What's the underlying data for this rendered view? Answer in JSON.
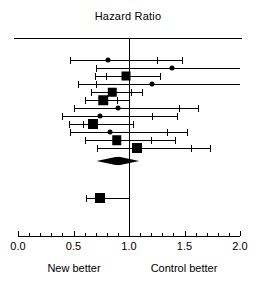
{
  "chart_data": {
    "type": "forest",
    "title": "Hazard Ratio",
    "xlabel": "",
    "ylabel": "",
    "xlim": [
      0.0,
      2.0
    ],
    "grid": false,
    "null_value": 1.0,
    "xticks": [
      0.0,
      0.5,
      1.0,
      1.5,
      2.0
    ],
    "xticklabels": [
      "0.0",
      "0.5",
      "1.0",
      "1.5",
      "2.0"
    ],
    "minor_tick_step": 0.1,
    "left_footer": "New better",
    "right_footer": "Control better",
    "marker_color": "#000000",
    "line_color": "#000000",
    "studies": [
      {
        "id": "study-1",
        "marker": "circle",
        "estimate": 0.81,
        "ci_low": 0.47,
        "ci_high": 1.48,
        "extra_cap": 1.25,
        "clipped_right": false,
        "size": 5.0
      },
      {
        "id": "study-2",
        "marker": "circle",
        "estimate": 1.39,
        "ci_low": 0.7,
        "ci_high": 2.0,
        "extra_cap": null,
        "clipped_right": true,
        "size": 5.0
      },
      {
        "id": "study-3",
        "marker": "square",
        "estimate": 0.97,
        "ci_low": 0.69,
        "ci_high": 1.28,
        "extra_cap": 0.79,
        "clipped_right": false,
        "size": 9.0
      },
      {
        "id": "study-4",
        "marker": "circle",
        "estimate": 1.21,
        "ci_low": 0.54,
        "ci_high": 2.0,
        "extra_cap": 0.7,
        "clipped_right": true,
        "size": 5.0
      },
      {
        "id": "study-5",
        "marker": "square",
        "estimate": 0.85,
        "ci_low": 0.66,
        "ci_high": 1.12,
        "extra_cap": 1.02,
        "clipped_right": false,
        "size": 8.5
      },
      {
        "id": "study-6",
        "marker": "square",
        "estimate": 0.77,
        "ci_low": 0.6,
        "ci_high": 1.0,
        "extra_cap": 0.89,
        "clipped_right": false,
        "size": 9.5
      },
      {
        "id": "study-7",
        "marker": "circle",
        "estimate": 0.9,
        "ci_low": 0.5,
        "ci_high": 1.62,
        "extra_cap": 1.45,
        "clipped_right": false,
        "size": 5.0
      },
      {
        "id": "study-8",
        "marker": "circle",
        "estimate": 0.74,
        "ci_low": 0.4,
        "ci_high": 1.43,
        "extra_cap": 1.21,
        "clipped_right": false,
        "size": 5.0
      },
      {
        "id": "study-9",
        "marker": "square",
        "estimate": 0.68,
        "ci_low": 0.46,
        "ci_high": 1.04,
        "extra_cap": 0.59,
        "clipped_right": false,
        "size": 10.0
      },
      {
        "id": "study-10",
        "marker": "circle",
        "estimate": 0.83,
        "ci_low": 0.47,
        "ci_high": 1.52,
        "extra_cap": 1.34,
        "clipped_right": false,
        "size": 5.0
      },
      {
        "id": "study-11",
        "marker": "square",
        "estimate": 0.89,
        "ci_low": 0.6,
        "ci_high": 1.41,
        "extra_cap": 1.2,
        "clipped_right": false,
        "size": 9.5
      },
      {
        "id": "study-12",
        "marker": "square",
        "estimate": 1.07,
        "ci_low": 0.71,
        "ci_high": 1.73,
        "extra_cap": 1.56,
        "clipped_right": false,
        "size": 10.0
      }
    ],
    "summary": {
      "id": "summary-diamond",
      "marker": "diamond",
      "estimate": 0.9,
      "ci_low": 0.78,
      "ci_high": 1.02
    },
    "separate": [
      {
        "id": "study-13",
        "marker": "square",
        "estimate": 0.74,
        "ci_low": 0.61,
        "ci_high": 1.0,
        "extra_cap": null,
        "clipped_right": false,
        "size": 10.0
      }
    ]
  }
}
